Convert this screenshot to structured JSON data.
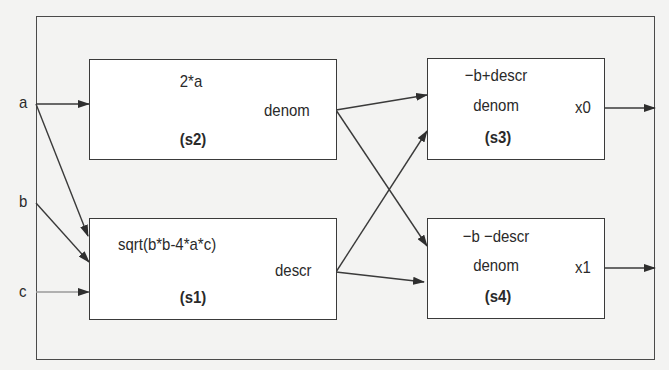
{
  "diagram": {
    "type": "dataflow",
    "inputs": [
      {
        "id": "a",
        "label": "a"
      },
      {
        "id": "b",
        "label": "b"
      },
      {
        "id": "c",
        "label": "c"
      }
    ],
    "blocks": {
      "s2": {
        "expr": "2*a",
        "output": "denom",
        "tag": "(s2)"
      },
      "s1": {
        "expr": "sqrt(b*b-4*a*c)",
        "output": "descr",
        "tag": "(s1)"
      },
      "s3": {
        "numerator": "−b+descr",
        "denominator": "denom",
        "output": "x0",
        "tag": "(s3)"
      },
      "s4": {
        "numerator": "−b −descr",
        "denominator": "denom",
        "output": "x1",
        "tag": "(s4)"
      }
    },
    "edges": [
      {
        "from": "a",
        "to": "s2"
      },
      {
        "from": "a",
        "to": "s1"
      },
      {
        "from": "b",
        "to": "s1"
      },
      {
        "from": "c",
        "to": "s1"
      },
      {
        "from": "s2.denom",
        "to": "s3"
      },
      {
        "from": "s2.denom",
        "to": "s4"
      },
      {
        "from": "s1.descr",
        "to": "s3"
      },
      {
        "from": "s1.descr",
        "to": "s4"
      },
      {
        "from": "s3.x0",
        "to": "out"
      },
      {
        "from": "s4.x1",
        "to": "out"
      }
    ],
    "colors": {
      "background": "#f3f3f2",
      "box_fill": "#ffffff",
      "line": "#3a3a3a"
    }
  }
}
